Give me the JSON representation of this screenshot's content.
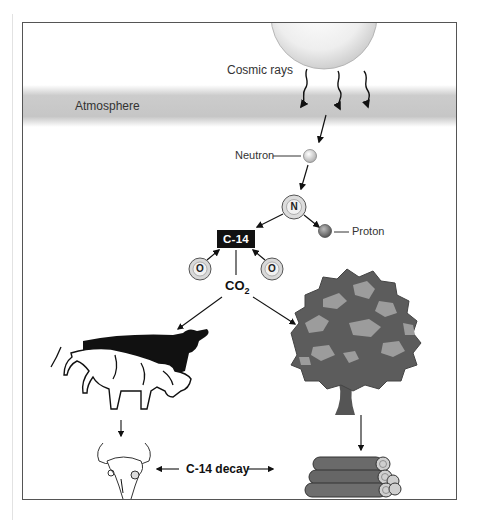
{
  "diagram": {
    "title_clipped": "",
    "labels": {
      "cosmic_rays": "Cosmic rays",
      "atmosphere": "Atmosphere",
      "neutron": "Neutron",
      "nitrogen": "N",
      "proton": "Proton",
      "carbon14": "C-14",
      "oxygen_left": "O",
      "oxygen_right": "O",
      "co2_main": "CO",
      "co2_sub": "2",
      "decay": "C-14 decay"
    },
    "nodes": [
      {
        "id": "sun",
        "desc": "source of cosmic rays"
      },
      {
        "id": "atmosphere",
        "desc": "grey band"
      },
      {
        "id": "neutron",
        "desc": "small light sphere"
      },
      {
        "id": "nitrogen",
        "desc": "atom N"
      },
      {
        "id": "proton",
        "desc": "small dark sphere"
      },
      {
        "id": "c14",
        "desc": "C-14 black box"
      },
      {
        "id": "oxygen",
        "count": 2
      },
      {
        "id": "co2"
      },
      {
        "id": "cattle",
        "desc": "two cows grazing"
      },
      {
        "id": "tree"
      },
      {
        "id": "skull",
        "desc": "animal skull"
      },
      {
        "id": "logs",
        "desc": "stacked logs"
      }
    ],
    "edges": [
      [
        "sun",
        "atmosphere"
      ],
      [
        "atmosphere",
        "neutron"
      ],
      [
        "neutron",
        "nitrogen"
      ],
      [
        "nitrogen",
        "c14"
      ],
      [
        "nitrogen",
        "proton"
      ],
      [
        "oxygen",
        "c14"
      ],
      [
        "c14",
        "co2"
      ],
      [
        "co2",
        "cattle"
      ],
      [
        "co2",
        "tree"
      ],
      [
        "cattle",
        "skull"
      ],
      [
        "tree",
        "logs"
      ],
      [
        "skull",
        "decay"
      ],
      [
        "logs",
        "decay"
      ]
    ],
    "colors": {
      "frame": "#555555",
      "atmosphere": "#c8c8c8",
      "tree_dark": "#5a5a5a",
      "tree_light": "#9a9a9a",
      "c14_box": "#111111"
    }
  }
}
